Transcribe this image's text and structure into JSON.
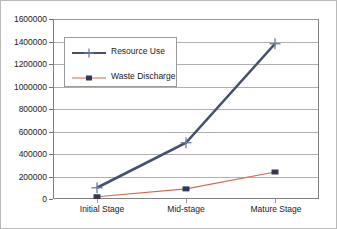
{
  "chart_data": {
    "type": "line",
    "title": "",
    "xlabel": "",
    "ylabel": "",
    "categories": [
      "Initial Stage",
      "Mid-stage",
      "Mature Stage"
    ],
    "ylim": [
      0,
      1600000
    ],
    "ytick_labels": [
      "0",
      "200000",
      "400000",
      "600000",
      "800000",
      "1000000",
      "1200000",
      "1400000",
      "1600000"
    ],
    "ytick_values": [
      0,
      200000,
      400000,
      600000,
      800000,
      1000000,
      1200000,
      1400000,
      1600000
    ],
    "grid": "horizontal",
    "legend_position": "upper-left-inside",
    "series": [
      {
        "name": "Resource Use",
        "values": [
          100000,
          500000,
          1380000
        ],
        "color": "#44506e",
        "marker": "plus",
        "marker_color": "#6d7c9c",
        "line_width": 2.6
      },
      {
        "name": "Waste Discharge",
        "values": [
          20000,
          90000,
          240000
        ],
        "color": "#d4694a",
        "marker": "square",
        "marker_color": "#2e3a5c",
        "line_width": 1.1
      }
    ]
  },
  "legend": {
    "items": [
      {
        "label": "Resource Use"
      },
      {
        "label": "Waste Discharge"
      }
    ]
  },
  "axes": {
    "y_labels": [
      "1600000",
      "1400000",
      "1200000",
      "1000000",
      "800000",
      "600000",
      "400000",
      "200000",
      "0"
    ],
    "x_labels": [
      "Initial Stage",
      "Mid-stage",
      "Mature Stage"
    ]
  },
  "colors": {
    "resource_use": "#44506e",
    "waste_discharge": "#d4694a",
    "grid": "#b0b0b0",
    "axis": "#808080",
    "background": "#ffffff",
    "text": "#1a1a1a"
  }
}
